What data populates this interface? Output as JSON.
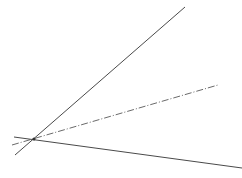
{
  "diagram": {
    "width": 242,
    "height": 178,
    "background": "#ffffff",
    "lines": [
      {
        "id": "steep-solid-line",
        "x1": 15,
        "y1": 155,
        "x2": 185,
        "y2": 7,
        "stroke": "#4a4a4a",
        "width": 1,
        "dash": ""
      },
      {
        "id": "dash-dot-line",
        "x1": 12,
        "y1": 145,
        "x2": 218,
        "y2": 85,
        "stroke": "#6a6a6a",
        "width": 1,
        "dash": "7 2 1 2"
      },
      {
        "id": "shallow-solid-line",
        "x1": 14,
        "y1": 137,
        "x2": 242,
        "y2": 168,
        "stroke": "#4a4a4a",
        "width": 1,
        "dash": ""
      }
    ],
    "intersection": {
      "x": 34,
      "y": 139,
      "fill": "#333333"
    }
  }
}
